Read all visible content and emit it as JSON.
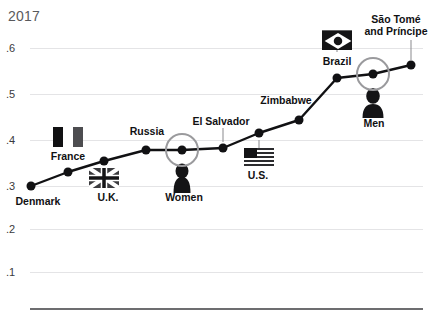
{
  "title": "2017",
  "chart_data": {
    "type": "line",
    "title": "2017",
    "xlabel": "",
    "ylabel": "",
    "ylim": [
      0,
      0.65
    ],
    "grid": true,
    "legend": "none",
    "y_ticks": [
      ".6",
      ".5",
      ".4",
      ".3",
      ".2",
      ".1"
    ],
    "y_tick_values": [
      0.6,
      0.5,
      0.4,
      0.3,
      0.2,
      0.1
    ],
    "categories": [
      "Denmark",
      "France",
      "U.K.",
      "Russia",
      "El Salvador",
      "Women",
      "U.S.",
      "Zimbabwe",
      "Brazil",
      "Men",
      "São Tomé and Príncipe"
    ],
    "values": [
      0.3,
      0.33,
      0.355,
      0.38,
      0.385,
      0.385,
      0.41,
      0.445,
      0.535,
      0.545,
      0.565
    ],
    "points": [
      {
        "label": "Denmark",
        "value": 0.3,
        "x": 31,
        "y": 186,
        "label_pos": "below",
        "label_x": 34,
        "label_y": 196,
        "highlight": false,
        "marker": "none"
      },
      {
        "label": "France",
        "value": 0.33,
        "x": 68,
        "y": 172,
        "label_pos": "above",
        "label_x": 68,
        "label_y": 152,
        "highlight": false,
        "marker": "flag-france"
      },
      {
        "label": "U.K.",
        "value": 0.355,
        "x": 104,
        "y": 161,
        "label_pos": "below",
        "label_x": 108,
        "label_y": 196,
        "highlight": false,
        "marker": "flag-uk"
      },
      {
        "label": "Russia",
        "value": 0.38,
        "x": 146,
        "y": 150,
        "label_pos": "above",
        "label_x": 147,
        "label_y": 128,
        "highlight": false,
        "marker": "none"
      },
      {
        "label": "Women",
        "value": 0.385,
        "x": 182,
        "y": 150,
        "label_pos": "below",
        "label_x": 183,
        "label_y": 196,
        "highlight": true,
        "marker": "icon-woman"
      },
      {
        "label": "El Salvador",
        "value": 0.39,
        "x": 223,
        "y": 148,
        "label_pos": "above",
        "label_x": 219,
        "label_y": 117,
        "highlight": false,
        "marker": "none"
      },
      {
        "label": "U.S.",
        "value": 0.41,
        "x": 259,
        "y": 133,
        "label_pos": "below",
        "label_x": 258,
        "label_y": 172,
        "highlight": false,
        "marker": "flag-us"
      },
      {
        "label": "Zimbabwe",
        "value": 0.445,
        "x": 299,
        "y": 120,
        "label_pos": "above",
        "label_x": 286,
        "label_y": 97,
        "highlight": false,
        "marker": "none"
      },
      {
        "label": "Brazil",
        "value": 0.535,
        "x": 337,
        "y": 78,
        "label_pos": "above",
        "label_x": 336,
        "label_y": 59,
        "highlight": false,
        "marker": "flag-brazil"
      },
      {
        "label": "Men",
        "value": 0.545,
        "x": 373,
        "y": 74,
        "label_pos": "below",
        "label_x": 374,
        "label_y": 120,
        "highlight": true,
        "marker": "icon-man"
      },
      {
        "label": "São Tomé and Príncipe",
        "value": 0.565,
        "x": 411,
        "y": 65,
        "label_pos": "above",
        "label_x": 395,
        "label_y": 16,
        "highlight": false,
        "marker": "none"
      }
    ],
    "annotations": {
      "highlight_ring_color": "#9a9a9d",
      "line_color": "#111113",
      "marker_color": "#111113",
      "grid_color": "#e4e4e6",
      "baseline_color": "#6d6d70",
      "title_color": "#59595c"
    },
    "labels": {
      "denmark": "Denmark",
      "france": "France",
      "uk": "U.K.",
      "russia": "Russia",
      "women": "Women",
      "el_salvador": "El Salvador",
      "us": "U.S.",
      "zimbabwe": "Zimbabwe",
      "brazil": "Brazil",
      "men": "Men",
      "sao_tome_line1": "São Tomé",
      "sao_tome_line2": "and Príncipe"
    },
    "icons": {
      "flag_france": "flag-france-icon",
      "flag_uk": "flag-uk-icon",
      "flag_us": "flag-us-icon",
      "flag_brazil": "flag-brazil-icon",
      "woman": "woman-silhouette-icon",
      "man": "man-silhouette-icon"
    }
  }
}
